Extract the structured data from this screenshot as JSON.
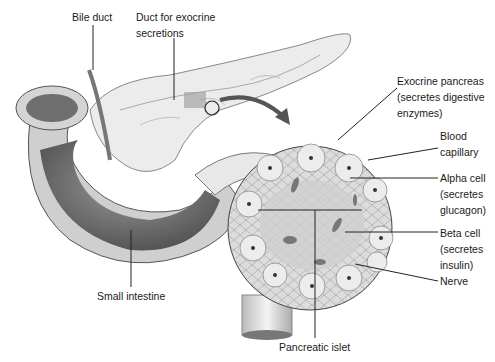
{
  "diagram": {
    "labels": {
      "bile_duct": [
        "Bile duct"
      ],
      "duct_exocrine": [
        "Duct for exocrine",
        "secretions"
      ],
      "exocrine_pancreas": [
        "Exocrine pancreas",
        "(secretes digestive",
        "enzymes)"
      ],
      "blood_capillary": [
        "Blood",
        "capillary"
      ],
      "alpha_cell": [
        "Alpha cell",
        "(secretes",
        "glucagon)"
      ],
      "beta_cell": [
        "Beta cell",
        "(secretes",
        "insulin)"
      ],
      "nerve": [
        "Nerve"
      ],
      "small_intestine": [
        "Small intestine"
      ],
      "pancreatic_islet": [
        "Pancreatic islet"
      ]
    },
    "colors": {
      "background": "#ffffff",
      "line": "#222222",
      "tissue_light": "#e6e6e6",
      "tissue_mid": "#bdbdbd",
      "tissue_dark": "#6e6e6e",
      "arrow": "#555555"
    }
  }
}
